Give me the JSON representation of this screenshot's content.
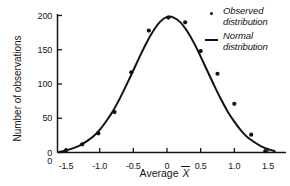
{
  "figure": {
    "background_color": "#ffffff",
    "ink_color": "#111111"
  },
  "axes": {
    "x_title_prefix": "Average ",
    "x_title_symbol": "X",
    "y_title": "Number of observations",
    "origin_label": "0",
    "x_tick_labels": [
      "-1.5",
      "-1.0",
      "-0.5",
      "0",
      "0.5",
      "1.0",
      "1.5"
    ],
    "x_tick_values": [
      -1.5,
      -1.0,
      -0.5,
      0,
      0.5,
      1.0,
      1.5
    ],
    "y_tick_labels": [
      "0",
      "50",
      "100",
      "150",
      "200"
    ],
    "y_tick_values": [
      0,
      50,
      100,
      150,
      200
    ]
  },
  "legend": {
    "position": "top-right",
    "entries": [
      {
        "marker": "dot-marker",
        "label": "Observed\ndistribution"
      },
      {
        "marker": "line-marker",
        "label": "Normal\ndistribution"
      }
    ]
  },
  "chart_data": {
    "type": "scatter",
    "title": "",
    "subtitle": "",
    "xlabel": "Average X̄",
    "ylabel": "Number of observations",
    "xlim": [
      -1.6,
      1.6
    ],
    "ylim": [
      0,
      205
    ],
    "grid": false,
    "legend_position": "top-right",
    "annotations": [],
    "series": [
      {
        "name": "Observed distribution",
        "type": "scatter",
        "marker": "filled-circle",
        "color": "#111111",
        "x": [
          -1.5,
          -1.26,
          -1.02,
          -0.78,
          -0.53,
          -0.27,
          0.02,
          0.27,
          0.5,
          0.75,
          1.0,
          1.25,
          1.46
        ],
        "y": [
          3,
          12,
          28,
          59,
          117,
          178,
          197,
          190,
          148,
          115,
          71,
          26,
          2
        ]
      },
      {
        "name": "Normal distribution",
        "type": "line",
        "color": "#111111",
        "x": [
          -1.6,
          -1.5,
          -1.4,
          -1.3,
          -1.2,
          -1.1,
          -1.0,
          -0.9,
          -0.8,
          -0.7,
          -0.6,
          -0.5,
          -0.4,
          -0.3,
          -0.2,
          -0.1,
          0.0,
          0.1,
          0.2,
          0.3,
          0.4,
          0.5,
          0.6,
          0.7,
          0.8,
          0.9,
          1.0,
          1.1,
          1.2,
          1.3,
          1.4,
          1.5,
          1.6
        ],
        "y": [
          1,
          3,
          6,
          10,
          16,
          23,
          33,
          46,
          61,
          79,
          99,
          120,
          141,
          161,
          178,
          191,
          198,
          197,
          190,
          177,
          160,
          140,
          119,
          98,
          78,
          60,
          45,
          32,
          22,
          15,
          9,
          5,
          2
        ]
      }
    ]
  }
}
